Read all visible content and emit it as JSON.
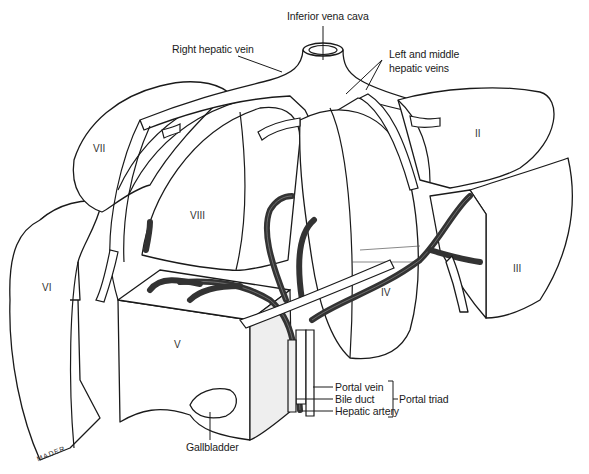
{
  "figure": {
    "structure_labels": {
      "ivc": "Inferior vena cava",
      "right_hepatic_vein": "Right hepatic vein",
      "left_middle_hepatic_veins_line1": "Left and middle",
      "left_middle_hepatic_veins_line2": "hepatic veins",
      "portal_vein": "Portal vein",
      "bile_duct": "Bile duct",
      "hepatic_artery": "Hepatic artery",
      "portal_triad": "Portal triad",
      "gallbladder": "Gallbladder"
    },
    "segments": {
      "II": "II",
      "III": "III",
      "IV": "IV",
      "V": "V",
      "VI": "VI",
      "VII": "VII",
      "VIII": "VIII"
    },
    "artist_signature": "MADER",
    "colors": {
      "line": "#1a1a1a",
      "background": "#ffffff",
      "shading": "#eeeeee"
    }
  }
}
